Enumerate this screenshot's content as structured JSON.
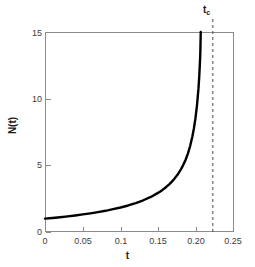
{
  "chart_data": {
    "type": "line",
    "title": "",
    "subtitle": "",
    "xlabel": "t",
    "ylabel": "N(t)",
    "xlim": [
      0,
      0.25
    ],
    "ylim": [
      0,
      15
    ],
    "grid": false,
    "legend": null,
    "xticks": [
      0,
      0.05,
      0.1,
      0.15,
      0.2,
      0.25
    ],
    "xtick_labels": [
      "0",
      "0.05",
      "0.1",
      "0.15",
      "0.20",
      "0.25"
    ],
    "yticks": [
      0,
      5,
      10,
      15
    ],
    "ytick_labels": [
      "0",
      "5",
      "10",
      "15"
    ],
    "series": [
      {
        "name": "N(t)",
        "style": "solid",
        "color": "#000000",
        "width": 2.4,
        "x": [
          0.0,
          0.01,
          0.02,
          0.03,
          0.04,
          0.05,
          0.06,
          0.07,
          0.08,
          0.09,
          0.1,
          0.11,
          0.12,
          0.13,
          0.14,
          0.15,
          0.155,
          0.16,
          0.165,
          0.17,
          0.175,
          0.18,
          0.183,
          0.186,
          0.189,
          0.192,
          0.195,
          0.197,
          0.199,
          0.201,
          0.203,
          0.204,
          0.205,
          0.2055,
          0.206
        ],
        "y": [
          1.0,
          1.05,
          1.11,
          1.17,
          1.24,
          1.32,
          1.4,
          1.49,
          1.59,
          1.71,
          1.84,
          1.99,
          2.17,
          2.38,
          2.63,
          2.95,
          3.14,
          3.36,
          3.61,
          3.91,
          4.27,
          4.72,
          5.04,
          5.42,
          5.88,
          6.45,
          7.18,
          7.78,
          8.52,
          9.47,
          10.77,
          11.64,
          12.78,
          13.55,
          15.0
        ]
      }
    ],
    "annotations": [
      {
        "name": "critical-time",
        "label": "t",
        "subscript": "c",
        "type": "vline",
        "x": 0.222,
        "style": "dashed",
        "color": "#4d4d4d"
      }
    ],
    "colors": {
      "curve": "#000000",
      "axis": "#8c8c8c",
      "tick_text": "#3b3b3b",
      "axis_title": "#1a1a1a",
      "annotation": "#4d4d4d",
      "background": "#ffffff"
    }
  }
}
